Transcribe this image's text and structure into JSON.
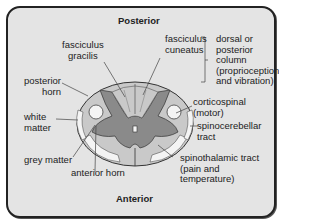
{
  "title_top": "Posterior",
  "title_bottom": "Anterior",
  "labels": {
    "fasciculus_gracilis": "fasciculus\ngracilis",
    "fasciculus_cuneatus": "fasciculus\ncuneatus",
    "dorsal_column": "dorsal or\nposterior\ncolumn\n(proprioception\nand vibration)",
    "posterior_horn": "posterior\nhorn",
    "white_matter": "white\nmatter",
    "corticospinal": "corticospinal\n(motor)",
    "spinocerebellar": "spinocerebellar\ntract",
    "grey_matter": "grey matter",
    "anterior_horn": "anterior horn",
    "spinothalamic": "spinothalamic tract\n(pain and\ntemperature)"
  },
  "colors": {
    "background": "#e4e4e4",
    "white_matter": "#c9c9c9",
    "grey_matter": "#8a8a8a",
    "tract_light": "#f4f4f4",
    "outline": "#333333"
  }
}
